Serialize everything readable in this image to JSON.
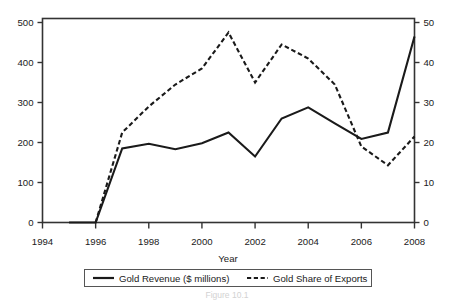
{
  "figure": {
    "top_cut_text": "",
    "caption": "Figure 10.1",
    "background": "#ffffff",
    "line_color": "#1a1a1a"
  },
  "chart_data": {
    "type": "line",
    "title": "",
    "xlabel": "Year",
    "ylabel": "",
    "ylabel_right": "",
    "grid": false,
    "legend_position": "bottom",
    "xlim": [
      1994,
      2008
    ],
    "xticks": [
      1994,
      1996,
      1998,
      2000,
      2002,
      2004,
      2006,
      2008
    ],
    "xticklabels": [
      "1994",
      "1996",
      "1998",
      "2000",
      "2002",
      "2004",
      "2006",
      "2008"
    ],
    "ylim_left": [
      0,
      500
    ],
    "yticks_left": [
      0,
      100,
      200,
      300,
      400,
      500
    ],
    "yticklabels_left": [
      "0",
      "100",
      "200",
      "300",
      "400",
      "500"
    ],
    "ylim_right": [
      0,
      50
    ],
    "yticks_right": [
      0,
      10,
      20,
      30,
      40,
      50
    ],
    "yticklabels_right": [
      "0",
      "10",
      "20",
      "30",
      "40",
      "50"
    ],
    "series": [
      {
        "name": "Gold Revenue ($ millions)",
        "axis": "left",
        "style": "solid",
        "color": "#1a1a1a",
        "x": [
          1995,
          1996,
          1997,
          1998,
          1999,
          2000,
          2001,
          2002,
          2003,
          2004,
          2005,
          2006,
          2007,
          2008
        ],
        "values": [
          0,
          0,
          185,
          197,
          183,
          198,
          225,
          165,
          260,
          288,
          248,
          209,
          225,
          465
        ]
      },
      {
        "name": "Gold Share of Exports",
        "axis": "right",
        "style": "dashed",
        "color": "#1a1a1a",
        "x": [
          1996,
          1997,
          1998,
          1999,
          2000,
          2001,
          2002,
          2003,
          2004,
          2005,
          2006,
          2007,
          2008
        ],
        "values": [
          0,
          22.5,
          29,
          34.5,
          38.5,
          47.5,
          35,
          44.5,
          41,
          34.5,
          19,
          14.3,
          21.5
        ]
      }
    ]
  },
  "legend": {
    "items": [
      {
        "label": "Gold Revenue ($ millions)",
        "style": "solid"
      },
      {
        "label": "Gold Share of Exports",
        "style": "dashed"
      }
    ]
  }
}
